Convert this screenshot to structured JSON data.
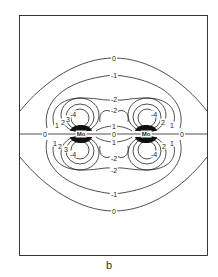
{
  "figure": {
    "caption": "b",
    "atoms": [
      {
        "label": "Mo",
        "x": 81,
        "y": 134
      },
      {
        "label": "Mo",
        "x": 146,
        "y": 134
      }
    ],
    "axis_labels": [
      {
        "text": "0",
        "x": 45,
        "y": 134
      },
      {
        "text": "0",
        "x": 114,
        "y": 134
      },
      {
        "text": "0",
        "x": 182,
        "y": 134
      }
    ],
    "contour_labels": [
      {
        "text": "0",
        "x": 114,
        "y": 58
      },
      {
        "text": "-1",
        "x": 114,
        "y": 75
      },
      {
        "text": "-2",
        "x": 114,
        "y": 99
      },
      {
        "text": "-2",
        "x": 114,
        "y": 110
      },
      {
        "text": "1",
        "x": 114,
        "y": 126
      },
      {
        "text": "-4",
        "x": 73,
        "y": 114
      },
      {
        "text": "-4",
        "x": 154,
        "y": 114
      },
      {
        "text": "1",
        "x": 57,
        "y": 125
      },
      {
        "text": "2",
        "x": 63,
        "y": 122
      },
      {
        "text": "3",
        "x": 68,
        "y": 119
      },
      {
        "text": "2",
        "x": 163,
        "y": 122
      },
      {
        "text": "1",
        "x": 172,
        "y": 125
      },
      {
        "text": "1",
        "x": 114,
        "y": 142
      },
      {
        "text": "-2",
        "x": 114,
        "y": 158
      },
      {
        "text": "-2",
        "x": 114,
        "y": 170
      },
      {
        "text": "-1",
        "x": 114,
        "y": 194
      },
      {
        "text": "0",
        "x": 114,
        "y": 211
      },
      {
        "text": "-4",
        "x": 73,
        "y": 154
      },
      {
        "text": "-4",
        "x": 154,
        "y": 154
      },
      {
        "text": "1",
        "x": 55,
        "y": 143
      },
      {
        "text": "2",
        "x": 60,
        "y": 146
      },
      {
        "text": "3",
        "x": 66,
        "y": 149
      },
      {
        "text": "2",
        "x": 164,
        "y": 146
      },
      {
        "text": "1",
        "x": 172,
        "y": 143
      }
    ]
  }
}
